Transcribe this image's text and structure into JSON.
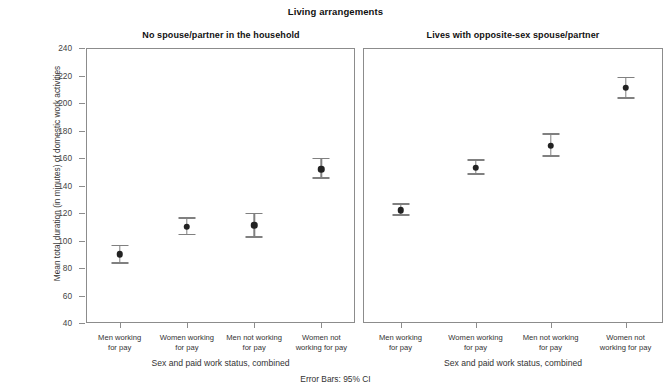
{
  "chart_data": {
    "type": "scatter",
    "title": "Living arrangements",
    "xlabel": "Sex and paid work status, combined",
    "ylabel": "Mean total duration (in minutes) of domestic work activities",
    "footnote": "Error Bars: 95% CI",
    "ylim": [
      40,
      240
    ],
    "ytick_labels": [
      "240",
      "220",
      "200",
      "180",
      "160",
      "140",
      "120",
      "100",
      "80",
      "60",
      "40"
    ],
    "yticks": [
      240,
      220,
      200,
      180,
      160,
      140,
      120,
      100,
      80,
      60,
      40
    ],
    "grid": false,
    "legend": "none",
    "categories": [
      "Men working for pay",
      "Women working for pay",
      "Men not working for pay",
      "Women not working for pay"
    ],
    "panels": [
      {
        "title": "No spouse/partner in the household",
        "points": [
          {
            "category": "Men working for pay",
            "value": 90,
            "ci_low": 83,
            "ci_high": 97
          },
          {
            "category": "Women working for pay",
            "value": 110,
            "ci_low": 104,
            "ci_high": 117
          },
          {
            "category": "Men not working for pay",
            "value": 111,
            "ci_low": 102,
            "ci_high": 120
          },
          {
            "category": "Women not working for pay",
            "value": 152,
            "ci_low": 145,
            "ci_high": 160
          }
        ]
      },
      {
        "title": "Lives with opposite-sex spouse/partner",
        "points": [
          {
            "category": "Men working for pay",
            "value": 122,
            "ci_low": 118,
            "ci_high": 127
          },
          {
            "category": "Women working for pay",
            "value": 153,
            "ci_low": 148,
            "ci_high": 159
          },
          {
            "category": "Men not working for pay",
            "value": 169,
            "ci_low": 161,
            "ci_high": 178
          },
          {
            "category": "Women not working for pay",
            "value": 211,
            "ci_low": 203,
            "ci_high": 219
          }
        ]
      }
    ]
  },
  "axis_labels": {
    "x_category_lines": [
      [
        "Men working",
        "for pay"
      ],
      [
        "Women working",
        "for pay"
      ],
      [
        "Men not working",
        "for pay"
      ],
      [
        "Women not",
        "working for pay"
      ]
    ]
  },
  "colors": {
    "marker": "#222222",
    "error_bar": "#808080",
    "frame": "#8c8c8c",
    "text": "#333333"
  }
}
